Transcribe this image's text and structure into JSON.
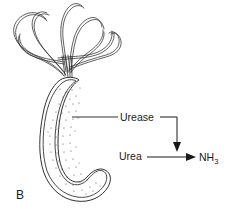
{
  "figure": {
    "panel_letter": "B",
    "background_color": "#ffffff",
    "ink_color": "#1a1a1a",
    "width": 229,
    "height": 216
  },
  "labels": {
    "urease": "Urease",
    "urea": "Urea",
    "ammonia_base": "NH",
    "ammonia_subscript": "3"
  },
  "organism": {
    "name": "curved-rod-bacterium",
    "shape": "vibrio-comma-shaped",
    "flagella_count": 6,
    "flagella_arrangement": "lophotrichous-polar-tuft",
    "cytoplasm_texture": "stippled"
  },
  "reaction": {
    "substrate": "Urea",
    "enzyme": "Urease",
    "product": "NH3"
  },
  "elements": {
    "leader_line_name": "urease-leader-line",
    "enzyme_connector_name": "urease-to-reaction-connector",
    "reaction_arrow_name": "urea-to-ammonia-arrow"
  }
}
